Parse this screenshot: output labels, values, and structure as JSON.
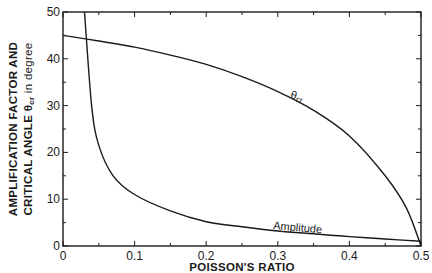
{
  "chart_data": {
    "type": "line",
    "title": "",
    "xlabel": "POISSON'S RATIO",
    "ylabel_line1": "AMPLIFICATION FACTOR AND",
    "ylabel_line2": "CRITICAL ANGLE θcr in degree",
    "xlim": [
      0,
      0.5
    ],
    "ylim": [
      0,
      50
    ],
    "x_ticks": [
      0,
      0.1,
      0.2,
      0.3,
      0.4,
      0.5
    ],
    "x_tick_labels": [
      "0",
      "0.1",
      "0.2",
      "0.3",
      "0.4",
      "0.5"
    ],
    "y_ticks": [
      0,
      10,
      20,
      30,
      40,
      50
    ],
    "y_tick_labels": [
      "0",
      "10",
      "20",
      "30",
      "40",
      "50"
    ],
    "grid": false,
    "legend": "none (inline curve labels)",
    "series": [
      {
        "name": "θcr",
        "label_text": "θcr",
        "x": [
          0,
          0.05,
          0.1,
          0.15,
          0.2,
          0.25,
          0.3,
          0.35,
          0.4,
          0.45,
          0.48,
          0.5
        ],
        "values": [
          45,
          43.8,
          42.5,
          40.8,
          38.8,
          36.2,
          33,
          29,
          23.5,
          15,
          8,
          0
        ]
      },
      {
        "name": "Amplitude",
        "label_text": "Amplitude",
        "x": [
          0.03,
          0.04,
          0.05,
          0.07,
          0.1,
          0.15,
          0.2,
          0.25,
          0.3,
          0.35,
          0.4,
          0.45,
          0.5
        ],
        "values": [
          50,
          30,
          21.5,
          15,
          11,
          7.5,
          5.2,
          4.1,
          3.2,
          2.6,
          2.0,
          1.5,
          1.0
        ]
      }
    ]
  }
}
